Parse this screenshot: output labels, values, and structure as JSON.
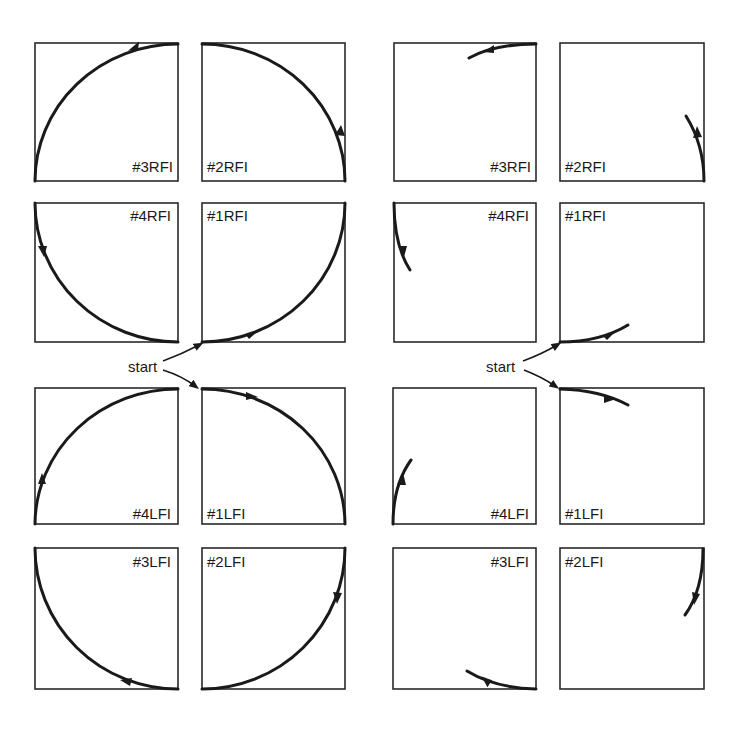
{
  "diagram": {
    "left_panel": {
      "description": "Full quarter-circle paths",
      "start_label": "start",
      "boxes": [
        {
          "label": "#3RFI"
        },
        {
          "label": "#2RFI"
        },
        {
          "label": "#4RFI"
        },
        {
          "label": "#1RFI"
        },
        {
          "label": "#4LFI"
        },
        {
          "label": "#1LFI"
        },
        {
          "label": "#3LFI"
        },
        {
          "label": "#2LFI"
        }
      ]
    },
    "right_panel": {
      "description": "Short arc segments at start of each quarter",
      "start_label": "start",
      "boxes": [
        {
          "label": "#3RFI"
        },
        {
          "label": "#2RFI"
        },
        {
          "label": "#4RFI"
        },
        {
          "label": "#1RFI"
        },
        {
          "label": "#4LFI"
        },
        {
          "label": "#1LFI"
        },
        {
          "label": "#3LFI"
        },
        {
          "label": "#2LFI"
        }
      ]
    },
    "colors": {
      "line": "#1a1a1a",
      "background": "#ffffff"
    }
  }
}
